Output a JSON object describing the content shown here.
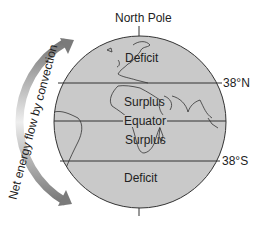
{
  "title": "North Pole",
  "zones": {
    "north_deficit": "Deficit",
    "north_surplus": "Surplus",
    "equator": "Equator",
    "south_surplus": "Surplus",
    "south_deficit": "Deficit"
  },
  "latitudes": {
    "north": "38°N",
    "south": "38°S"
  },
  "arrow_label": "Net energy flow by convection",
  "colors": {
    "globe_fill": "#c9c9c9",
    "outline": "#333333",
    "arrow": "#8a8a8a"
  }
}
